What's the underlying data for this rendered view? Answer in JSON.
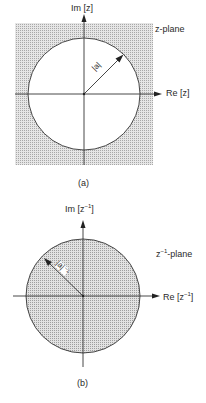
{
  "figure_a": {
    "im_label": "Im [z]",
    "re_label": "Re [z]",
    "plane_label": "z-plane",
    "radius_label": "|a|",
    "caption": "(a)",
    "region": "outside circle shaded"
  },
  "figure_b": {
    "im_label_base": "Im [z",
    "im_label_sup": "−1",
    "im_label_end": "]",
    "re_label_base": "Re [z",
    "re_label_sup": "−1",
    "re_label_end": "]",
    "plane_label_base": "z",
    "plane_label_sup": "−1",
    "plane_label_end": "-plane",
    "radius_label": "|a|⁻¹",
    "caption": "(b)",
    "region": "inside circle shaded"
  },
  "colors": {
    "shade": "#d4d4d4",
    "line": "#333333"
  }
}
